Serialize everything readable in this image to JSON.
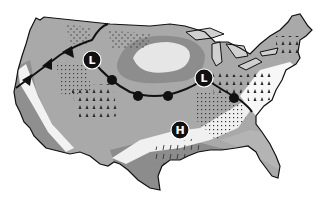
{
  "map": {
    "type": "weather-map",
    "region": "contiguous United States",
    "colors": {
      "background": "#ffffff",
      "land_mid": "#a9a9a9",
      "land_dark": "#8a8a8a",
      "land_light": "#c4c4c4",
      "clear_band": "#f2f2f2",
      "water": "#d0d0d0",
      "front_line": "#111111",
      "symbol_fill": "#111111",
      "symbol_text": "#ffffff"
    },
    "pressure_systems": [
      {
        "label": "L",
        "kind": "low",
        "x": 92,
        "y": 60
      },
      {
        "label": "L",
        "kind": "low",
        "x": 204,
        "y": 78
      },
      {
        "label": "H",
        "kind": "high",
        "x": 180,
        "y": 130
      }
    ],
    "fronts": [
      {
        "kind": "cold-front",
        "description": "from Pacific Northwest coast to western low"
      },
      {
        "kind": "warm-front",
        "description": "from western low curving south and east to eastern low and down to the mid-Atlantic"
      }
    ],
    "precipitation_zones": [
      {
        "kind": "snow",
        "area": "northern Rockies / Montana"
      },
      {
        "kind": "snow",
        "area": "northern plains / Dakotas"
      },
      {
        "kind": "rain",
        "area": "Great Basin / Rockies"
      },
      {
        "kind": "showers",
        "area": "central Rockies / Colorado"
      },
      {
        "kind": "rain",
        "area": "Ohio Valley / Great Lakes"
      },
      {
        "kind": "rain",
        "area": "New England"
      },
      {
        "kind": "rain",
        "area": "mid-Atlantic"
      },
      {
        "kind": "drizzle",
        "area": "Tennessee Valley / Southeast"
      },
      {
        "kind": "thunderstorms",
        "area": "southern plains / Texas"
      }
    ],
    "clear_zone": {
      "area": "upper Midwest (Minnesota)"
    }
  }
}
